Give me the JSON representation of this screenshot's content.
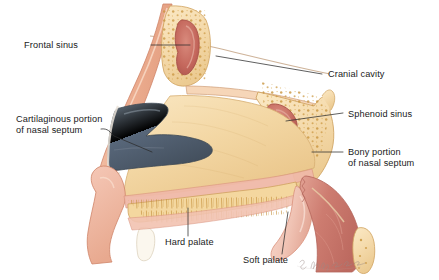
{
  "figure": {
    "signature": "S. Dagmar Tjomsaas"
  },
  "labels": [
    {
      "id": "frontal-sinus",
      "text": "Frontal sinus",
      "text2": "",
      "x": 78,
      "y": 48,
      "anchor": "start"
    },
    {
      "id": "cranial-cavity",
      "text": "Cranial cavity",
      "text2": "",
      "x": 328,
      "y": 77,
      "anchor": "start"
    },
    {
      "id": "cartilaginous",
      "text": "Cartilaginous portion",
      "text2": "of nasal septum",
      "x": 16,
      "y": 122,
      "anchor": "start"
    },
    {
      "id": "sphenoid-sinus",
      "text": "Sphenoid sinus",
      "text2": "",
      "x": 348,
      "y": 116,
      "anchor": "start"
    },
    {
      "id": "bony-portion",
      "text": "Bony portion",
      "text2": "of nasal septum",
      "x": 348,
      "y": 155,
      "anchor": "start"
    },
    {
      "id": "hard-palate",
      "text": "Hard palate",
      "text2": "",
      "x": 165,
      "y": 243,
      "anchor": "start"
    },
    {
      "id": "soft-palate",
      "text": "Soft palate",
      "text2": "",
      "x": 243,
      "y": 261,
      "anchor": "start"
    }
  ],
  "colors": {
    "skin": "#efb69a",
    "skin_light": "#f6cdb6",
    "skin_edge": "#d98e73",
    "bone_fill": "#f6ddb0",
    "bone_edge": "#cfa25e",
    "bone_stipple": "#c9953f",
    "septum_tan": "#f3d9a8",
    "septum_warm": "#eec98d",
    "cartilage": "#5d6b7a",
    "cartilage_dk": "#47525f",
    "sinus_red": "#c4675c",
    "sinus_red_dk": "#a9514a",
    "mucosa_pink": "#f0b9a8",
    "pharynx": "#c9736a",
    "palate_pink": "#f2c9bb",
    "outline": "#b9705a",
    "leader": "#2b2b2b",
    "text": "#1a1a1a"
  }
}
